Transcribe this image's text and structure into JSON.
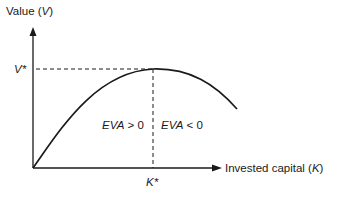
{
  "diagram": {
    "y_axis": {
      "label_prefix": "Value (",
      "label_var": "V",
      "label_suffix": ")"
    },
    "x_axis": {
      "label_prefix": "Invested capital (",
      "label_var": "K",
      "label_suffix": ")"
    },
    "markers": {
      "v_star": "V*",
      "k_star": "K*"
    },
    "regions": {
      "left": {
        "var": "EVA",
        "op": " > 0"
      },
      "right": {
        "var": "EVA",
        "op": " < 0"
      }
    },
    "colors": {
      "line": "#1a1a1a",
      "background": "#ffffff"
    }
  }
}
